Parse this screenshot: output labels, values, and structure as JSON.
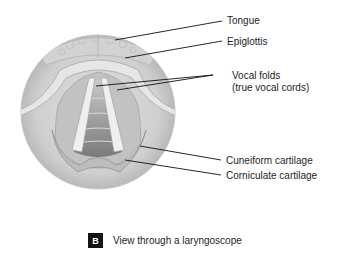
{
  "figure": {
    "title": "View through a laryngoscope",
    "panel_letter": "B",
    "labels": [
      {
        "id": "tongue",
        "text": "Tongue"
      },
      {
        "id": "epiglottis",
        "text": "Epiglottis"
      },
      {
        "id": "vocal-folds",
        "line1": "Vocal folds",
        "line2": "(true vocal cords)"
      },
      {
        "id": "cuneiform",
        "text": "Cuneiform cartilage"
      },
      {
        "id": "corniculate",
        "text": "Corniculate cartilage"
      }
    ]
  }
}
